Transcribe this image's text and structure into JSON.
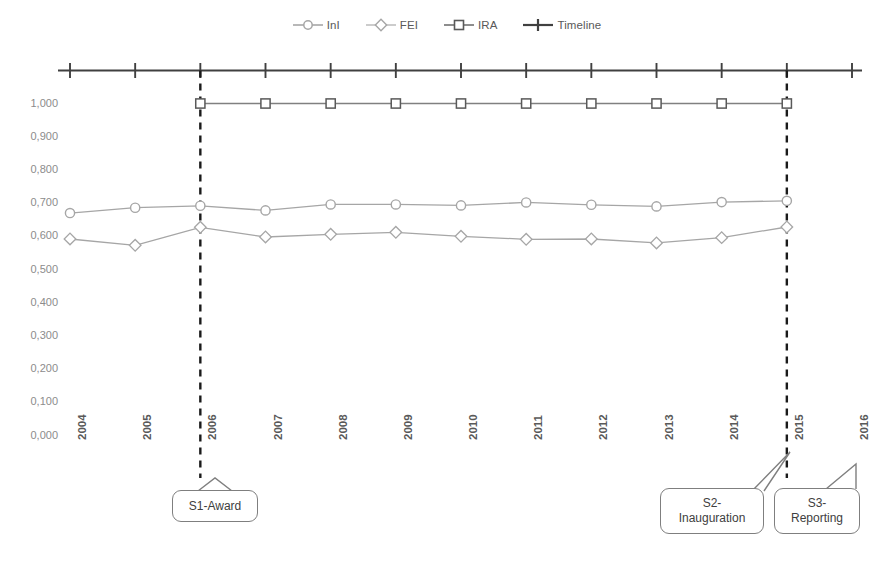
{
  "chart_data": {
    "type": "line",
    "title": "",
    "xlabel": "",
    "ylabel": "",
    "grid": false,
    "legend_position": "top-center",
    "categories": [
      "2004",
      "2005",
      "2006",
      "2007",
      "2008",
      "2009",
      "2010",
      "2011",
      "2012",
      "2013",
      "2014",
      "2015",
      "2016"
    ],
    "ylim": [
      0.0,
      1.0
    ],
    "ytick_labels": [
      "1,000",
      "0,900",
      "0,800",
      "0,700",
      "0,600",
      "0,500",
      "0,400",
      "0,300",
      "0,200",
      "0,100",
      "0,000"
    ],
    "ytick_values": [
      1.0,
      0.9,
      0.8,
      0.7,
      0.6,
      0.5,
      0.4,
      0.3,
      0.2,
      0.1,
      0.0
    ],
    "decimal_separator": ",",
    "series": [
      {
        "name": "InI",
        "marker": "circle",
        "color": "#a6a6a6",
        "x": [
          "2004",
          "2005",
          "2006",
          "2007",
          "2008",
          "2009",
          "2010",
          "2011",
          "2012",
          "2013",
          "2014",
          "2015"
        ],
        "values": [
          0.67,
          0.686,
          0.692,
          0.678,
          0.696,
          0.696,
          0.693,
          0.702,
          0.695,
          0.69,
          0.703,
          0.707
        ]
      },
      {
        "name": "FEI",
        "marker": "diamond",
        "color": "#a6a6a6",
        "x": [
          "2004",
          "2005",
          "2006",
          "2007",
          "2008",
          "2009",
          "2010",
          "2011",
          "2012",
          "2013",
          "2014",
          "2015"
        ],
        "values": [
          0.592,
          0.573,
          0.627,
          0.598,
          0.606,
          0.612,
          0.6,
          0.591,
          0.592,
          0.58,
          0.596,
          0.628
        ]
      },
      {
        "name": "IRA",
        "marker": "square",
        "color": "#808080",
        "x": [
          "2006",
          "2007",
          "2008",
          "2009",
          "2010",
          "2011",
          "2012",
          "2013",
          "2014",
          "2015"
        ],
        "values": [
          1.0,
          1.0,
          1.0,
          1.0,
          1.0,
          1.0,
          1.0,
          1.0,
          1.0,
          1.0
        ]
      },
      {
        "name": "Timeline",
        "marker": "plus",
        "color": "#404040",
        "x": [
          "2004",
          "2005",
          "2006",
          "2007",
          "2008",
          "2009",
          "2010",
          "2011",
          "2012",
          "2013",
          "2014",
          "2015",
          "2016"
        ],
        "values": [
          1.1,
          1.1,
          1.1,
          1.1,
          1.1,
          1.1,
          1.1,
          1.1,
          1.1,
          1.1,
          1.1,
          1.1,
          1.1
        ]
      }
    ],
    "annotations": [
      {
        "label_lines": [
          "S1-Award"
        ],
        "at_x": "2006"
      },
      {
        "label_lines": [
          "S2-",
          "Inauguration"
        ],
        "at_x": "2015"
      },
      {
        "label_lines": [
          "S3-",
          "Reporting"
        ],
        "at_x": "2015"
      }
    ],
    "event_markers": [
      {
        "x": "2006",
        "style": "dashed-vertical"
      },
      {
        "x": "2015",
        "style": "dashed-vertical"
      }
    ]
  },
  "legend": {
    "items": [
      {
        "label": "InI",
        "marker": "circle-marker-icon"
      },
      {
        "label": "FEI",
        "marker": "diamond-marker-icon"
      },
      {
        "label": "IRA",
        "marker": "square-marker-icon"
      },
      {
        "label": "Timeline",
        "marker": "plus-marker-icon"
      }
    ]
  },
  "axes": {
    "y_ticks": [
      "1,000",
      "0,900",
      "0,800",
      "0,700",
      "0,600",
      "0,500",
      "0,400",
      "0,300",
      "0,200",
      "0,100",
      "0,000"
    ],
    "x_ticks": [
      "2004",
      "2005",
      "2006",
      "2007",
      "2008",
      "2009",
      "2010",
      "2011",
      "2012",
      "2013",
      "2014",
      "2015",
      "2016"
    ]
  },
  "callouts": {
    "s1": {
      "line1": "S1-Award"
    },
    "s2": {
      "line1": "S2-",
      "line2": "Inauguration"
    },
    "s3": {
      "line1": "S3-",
      "line2": "Reporting"
    }
  }
}
